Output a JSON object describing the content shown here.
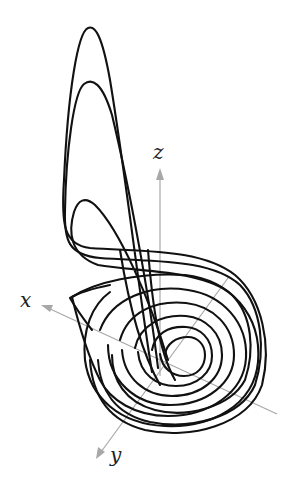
{
  "figure": {
    "axes": {
      "x": {
        "label": "x"
      },
      "y": {
        "label": "y"
      },
      "z": {
        "label": "z"
      }
    },
    "colors": {
      "curve": "#111111",
      "axis": "#a8a8a8",
      "background": "#ffffff"
    }
  }
}
